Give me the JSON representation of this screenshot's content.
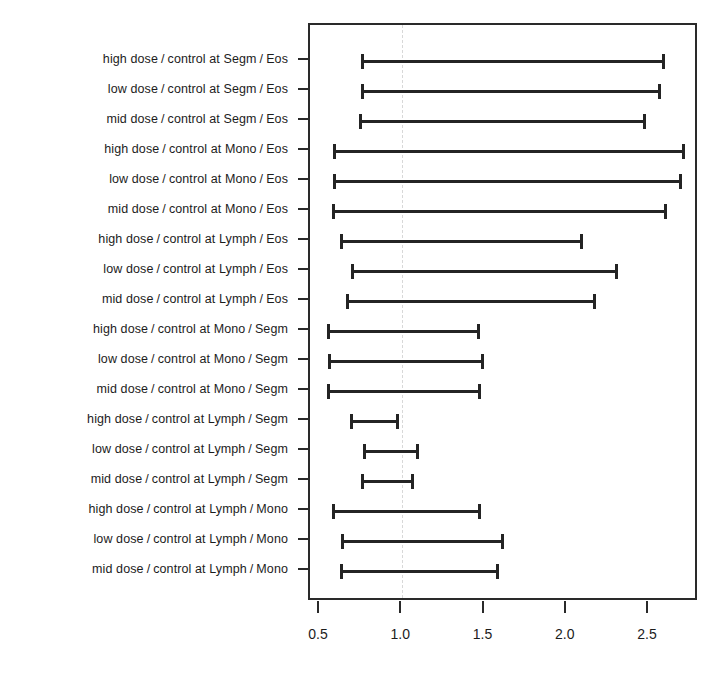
{
  "chart_data": {
    "type": "bar",
    "subtype": "confidence-interval-forest-plot",
    "title": "",
    "subtitle": "",
    "xlabel": "",
    "ylabel": "",
    "xlim": [
      0.38,
      2.72
    ],
    "ylim": [
      0,
      19
    ],
    "grid": false,
    "legend": null,
    "reference_line": 1.0,
    "xticks": [
      0.5,
      1.0,
      1.5,
      2.0,
      2.5
    ],
    "xticklabels": [
      "0.5",
      "1.0",
      "1.5",
      "2.0",
      "2.5"
    ],
    "categories": [
      "high dose / control at Segm / Eos",
      "low dose / control at Segm / Eos",
      "mid dose / control at Segm / Eos",
      "high dose / control at Mono / Eos",
      "low dose / control at Mono / Eos",
      "mid dose / control at Mono / Eos",
      "high dose / control at Lymph / Eos",
      "low dose / control at Lymph / Eos",
      "mid dose / control at Lymph / Eos",
      "high dose / control at Mono / Segm",
      "low dose / control at Mono / Segm",
      "mid dose / control at Mono / Segm",
      "high dose / control at Lymph / Segm",
      "low dose / control at Lymph / Segm",
      "mid dose / control at Lymph / Segm",
      "high dose / control at Lymph / Mono",
      "low dose / control at Lymph / Mono",
      "mid dose / control at Lymph / Mono"
    ],
    "intervals": [
      {
        "label": "high dose / control at Segm / Eos",
        "lower": 0.75,
        "upper": 2.6
      },
      {
        "label": "low dose / control at Segm / Eos",
        "lower": 0.75,
        "upper": 2.57
      },
      {
        "label": "mid dose / control at Segm / Eos",
        "lower": 0.74,
        "upper": 2.48
      },
      {
        "label": "high dose / control at Mono / Eos",
        "lower": 0.58,
        "upper": 2.72
      },
      {
        "label": "low dose / control at Mono / Eos",
        "lower": 0.58,
        "upper": 2.7
      },
      {
        "label": "mid dose / control at Mono / Eos",
        "lower": 0.57,
        "upper": 2.61
      },
      {
        "label": "high dose / control at Lymph / Eos",
        "lower": 0.62,
        "upper": 2.1
      },
      {
        "label": "low dose / control at Lymph / Eos",
        "lower": 0.69,
        "upper": 2.31
      },
      {
        "label": "mid dose / control at Lymph / Eos",
        "lower": 0.66,
        "upper": 2.18
      },
      {
        "label": "high dose / control at Mono / Segm",
        "lower": 0.54,
        "upper": 1.47
      },
      {
        "label": "low dose / control at Mono / Segm",
        "lower": 0.55,
        "upper": 1.5
      },
      {
        "label": "mid dose / control at Mono / Segm",
        "lower": 0.54,
        "upper": 1.48
      },
      {
        "label": "high dose / control at Lymph / Segm",
        "lower": 0.68,
        "upper": 0.98
      },
      {
        "label": "low dose / control at Lymph / Segm",
        "lower": 0.76,
        "upper": 1.1
      },
      {
        "label": "mid dose / control at Lymph / Segm",
        "lower": 0.75,
        "upper": 1.07
      },
      {
        "label": "high dose / control at Lymph / Mono",
        "lower": 0.57,
        "upper": 1.48
      },
      {
        "label": "low dose / control at Lymph / Mono",
        "lower": 0.63,
        "upper": 1.62
      },
      {
        "label": "mid dose / control at Lymph / Mono",
        "lower": 0.62,
        "upper": 1.59
      }
    ]
  },
  "labels": [
    {
      "dose": "high dose",
      "comparison": "control at Segm",
      "cell": "Eos"
    },
    {
      "dose": "low dose",
      "comparison": "control at Segm",
      "cell": "Eos"
    },
    {
      "dose": "mid dose",
      "comparison": "control at Segm",
      "cell": "Eos"
    },
    {
      "dose": "high dose",
      "comparison": "control at Mono",
      "cell": "Eos"
    },
    {
      "dose": "low dose",
      "comparison": "control at Mono",
      "cell": "Eos"
    },
    {
      "dose": "mid dose",
      "comparison": "control at Mono",
      "cell": "Eos"
    },
    {
      "dose": "high dose",
      "comparison": "control at Lymph",
      "cell": "Eos"
    },
    {
      "dose": "low dose",
      "comparison": "control at Lymph",
      "cell": "Eos"
    },
    {
      "dose": "mid dose",
      "comparison": "control at Lymph",
      "cell": "Eos"
    },
    {
      "dose": "high dose",
      "comparison": "control at Mono",
      "cell": "Segm"
    },
    {
      "dose": "low dose",
      "comparison": "control at Mono",
      "cell": "Segm"
    },
    {
      "dose": "mid dose",
      "comparison": "control at Mono",
      "cell": "Segm"
    },
    {
      "dose": "high dose",
      "comparison": "control at Lymph",
      "cell": "Segm"
    },
    {
      "dose": "low dose",
      "comparison": "control at Lymph",
      "cell": "Segm"
    },
    {
      "dose": "mid dose",
      "comparison": "control at Lymph",
      "cell": "Segm"
    },
    {
      "dose": "high dose",
      "comparison": "control at Lymph",
      "cell": "Mono"
    },
    {
      "dose": "low dose",
      "comparison": "control at Lymph",
      "cell": "Mono"
    },
    {
      "dose": "mid dose",
      "comparison": "control at Lymph",
      "cell": "Mono"
    }
  ],
  "separator": "/",
  "colors": {
    "line": "#242424",
    "frame": "#2a2a2a",
    "text": "#1c1c1c",
    "reference": "#d8d8d8",
    "background": "#ffffff"
  }
}
